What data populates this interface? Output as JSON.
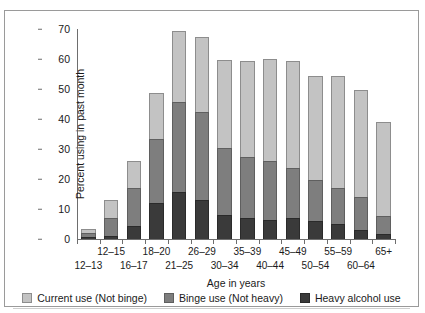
{
  "chart_data": {
    "type": "bar",
    "stacked": true,
    "title": "",
    "xlabel": "Age in years",
    "ylabel": "Percent using in past month",
    "ylim": [
      0,
      70
    ],
    "yticks": [
      0,
      10,
      20,
      30,
      40,
      50,
      60,
      70
    ],
    "grid": false,
    "legend_position": "bottom",
    "categories": [
      "12–13",
      "12–15",
      "16–17",
      "18–20",
      "21–25",
      "26–29",
      "30–34",
      "35–39",
      "40–44",
      "45–49",
      "50–54",
      "55–59",
      "60–64",
      "65+"
    ],
    "series": [
      {
        "name": "Heavy alcohol use",
        "color": "#3a3a3a",
        "values": [
          0.6,
          1.0,
          4.3,
          12.0,
          15.6,
          13.1,
          8.0,
          7.1,
          6.5,
          7.1,
          5.9,
          4.9,
          3.1,
          1.7
        ]
      },
      {
        "name": "Binge use (Not heavy)",
        "color": "#7e7e7e",
        "values": [
          1.3,
          6.0,
          12.8,
          21.4,
          30.1,
          29.2,
          22.5,
          20.2,
          19.5,
          16.5,
          13.8,
          12.1,
          11.0,
          5.9
        ]
      },
      {
        "name": "Current use (Not binge)",
        "color": "#c3c3c3",
        "values": [
          1.4,
          6.0,
          8.9,
          15.2,
          23.7,
          24.9,
          29.3,
          31.9,
          34.1,
          35.7,
          34.6,
          37.3,
          35.7,
          31.5
        ]
      }
    ],
    "totals": [
      3.3,
      13.0,
      26.0,
      48.6,
      69.4,
      67.2,
      59.8,
      59.2,
      60.1,
      59.3,
      54.3,
      54.3,
      49.8,
      39.1
    ]
  },
  "legend": {
    "items": [
      {
        "label": "Current use (Not binge)",
        "swatch": "light-gray-swatch"
      },
      {
        "label": "Binge use (Not heavy)",
        "swatch": "medium-gray-swatch"
      },
      {
        "label": "Heavy alcohol use",
        "swatch": "dark-gray-swatch"
      }
    ]
  },
  "axes": {
    "y_label": "Percent using in past month",
    "x_label": "Age in years"
  }
}
